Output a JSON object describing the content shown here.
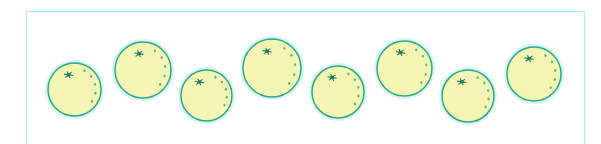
{
  "canvas": {
    "width": 601,
    "height": 144,
    "background": "#ffffff"
  },
  "frame": {
    "name": "image-border-frame",
    "x": 26,
    "y": 11,
    "width": 559,
    "height": 150,
    "stroke": "#aaf0ee",
    "stroke_width": 1.6,
    "bottom_edge_visible": false
  },
  "palette": {
    "fruit_fill": "#f6f6b4",
    "fruit_outline": "#2aa888",
    "fruit_outline_soft": "#49c0a4",
    "fruit_halo": "#d8f7f2",
    "stem_mark": "#1f7f63",
    "pore_dot": "#3fa98d",
    "frame_stroke": "#aaf0ee",
    "background": "#ffffff"
  },
  "scene": {
    "name": "row-of-citrus-fruit",
    "description": "Row of eight pale-yellow round citrus fruits with teal outlines arranged in an alternating high-low zigzag across a thin cyan rectangular frame",
    "fruit_count": 8,
    "fruit_label": "citrus-fruit"
  },
  "fruits": [
    {
      "id": 1,
      "cx": 74,
      "cy": 89,
      "r": 26.5,
      "stem_angle": -112,
      "pore_start": -62,
      "pore_count": 5,
      "pore_spread": 96
    },
    {
      "id": 2,
      "cx": 143,
      "cy": 70,
      "r": 28.0,
      "stem_angle": -104,
      "pore_start": -58,
      "pore_count": 5,
      "pore_spread": 98
    },
    {
      "id": 3,
      "cx": 206,
      "cy": 95,
      "r": 25.5,
      "stem_angle": -118,
      "pore_start": -64,
      "pore_count": 5,
      "pore_spread": 92
    },
    {
      "id": 4,
      "cx": 272,
      "cy": 68,
      "r": 29.0,
      "stem_angle": -106,
      "pore_start": -58,
      "pore_count": 5,
      "pore_spread": 100
    },
    {
      "id": 5,
      "cx": 338,
      "cy": 92,
      "r": 26.0,
      "stem_angle": -112,
      "pore_start": -60,
      "pore_count": 5,
      "pore_spread": 95
    },
    {
      "id": 6,
      "cx": 404,
      "cy": 68,
      "r": 27.5,
      "stem_angle": -104,
      "pore_start": -58,
      "pore_count": 5,
      "pore_spread": 98
    },
    {
      "id": 7,
      "cx": 468,
      "cy": 96,
      "r": 26.0,
      "stem_angle": -114,
      "pore_start": -62,
      "pore_count": 5,
      "pore_spread": 94
    },
    {
      "id": 8,
      "cx": 534,
      "cy": 74,
      "r": 27.0,
      "stem_angle": -108,
      "pore_start": -58,
      "pore_count": 5,
      "pore_spread": 97
    }
  ]
}
